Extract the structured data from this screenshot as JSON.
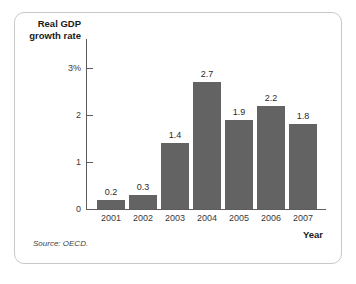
{
  "figure": {
    "source_note": "Source: OECD.",
    "frame_color": "#c9c9c9"
  },
  "chart_data": {
    "type": "bar",
    "title": "",
    "subtitle": "",
    "ylabel": "Real GDP\ngrowth rate",
    "ylabel_line1": "Real GDP",
    "ylabel_line2": "growth rate",
    "xlabel": "Year",
    "categories": [
      "2001",
      "2002",
      "2003",
      "2004",
      "2005",
      "2006",
      "2007"
    ],
    "values": [
      0.2,
      0.3,
      1.4,
      2.7,
      1.9,
      2.2,
      1.8
    ],
    "value_labels": [
      "0.2",
      "0.3",
      "1.4",
      "2.7",
      "1.9",
      "2.2",
      "1.8"
    ],
    "ylim": [
      0,
      3
    ],
    "yticks": [
      0,
      1,
      2,
      3
    ],
    "ytick_labels": [
      "0",
      "1",
      "2",
      "3%"
    ],
    "grid": false,
    "legend": null,
    "bar_color": "#636363",
    "axis_color": "#5d5d5d",
    "units": "percent"
  }
}
